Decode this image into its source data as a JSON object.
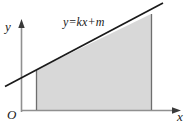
{
  "figure": {
    "colors": {
      "stroke": "#1a1a1a",
      "axis": "#8a8a8a",
      "fill": "#d8d8d8",
      "background": "#ffffff"
    },
    "axes": {
      "y_label": "y",
      "x_label": "x",
      "origin_label": "O"
    },
    "annotations": {
      "line_equation": "y=kx+m"
    },
    "geometry": {
      "origin": [
        21,
        110
      ],
      "x_axis": [
        [
          21,
          110
        ],
        [
          178,
          110
        ]
      ],
      "y_axis": [
        [
          21,
          110
        ],
        [
          21,
          20
        ]
      ],
      "line_start": [
        5,
        86
      ],
      "line_end": [
        163,
        3
      ],
      "region_left_x": 36,
      "region_right_x": 151,
      "region_baseline_y": 110,
      "region_top_left_y": 70,
      "region_top_right_y": 14
    }
  }
}
